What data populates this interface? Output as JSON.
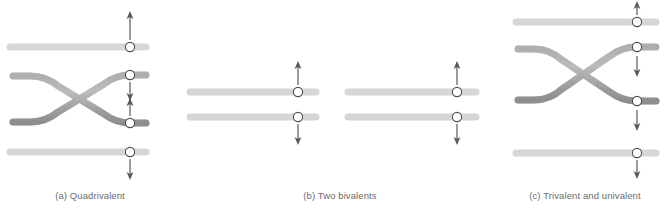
{
  "figure": {
    "type": "diagram",
    "background_color": "#ffffff",
    "chromosome_fill": "#a8a8a8",
    "chromosome_highlight": "#cfcfcf",
    "chromosome_outline": "#6e6e6e",
    "centromere_fill": "#ffffff",
    "centromere_outline": "#4d4d4d",
    "arrow_color": "#58595b",
    "caption_color": "#6b6c6e"
  },
  "panels": [
    {
      "id": "a",
      "label": "(a) Quadrivalent",
      "chromosome_count": 4,
      "crossover": true,
      "crossover_between": [
        2,
        3
      ],
      "chromosomes": [
        {
          "index": 1,
          "shape": "straight",
          "y": 47,
          "x_start": 8,
          "x_end": 148,
          "centromere_x": 130,
          "arrow": {
            "direction": "up",
            "position": "above"
          }
        },
        {
          "index": 2,
          "shape": "crossing",
          "y_left": 75,
          "y_right": 74,
          "x_start": 12,
          "x_end": 148,
          "centromere_x": 130,
          "arrow": {
            "direction": "down",
            "position": "below"
          }
        },
        {
          "index": 3,
          "shape": "crossing",
          "y_left": 122,
          "y_right": 123,
          "x_start": 12,
          "x_end": 148,
          "centromere_x": 130,
          "arrow": {
            "direction": "up",
            "position": "above"
          }
        },
        {
          "index": 4,
          "shape": "straight",
          "y": 152,
          "x_start": 8,
          "x_end": 148,
          "centromere_x": 130,
          "arrow": {
            "direction": "down",
            "position": "below"
          }
        }
      ],
      "arrow_sequence": [
        "up",
        "down",
        "up",
        "down"
      ]
    },
    {
      "id": "b",
      "label": "(b) Two bivalents",
      "chromosome_count": 4,
      "crossover": false,
      "groups": [
        {
          "name": "bivalent-left",
          "chromosomes": [
            {
              "index": 1,
              "shape": "straight",
              "y": 92,
              "x_start": 8,
              "x_end": 138,
              "centromere_x": 118,
              "arrow": {
                "direction": "up",
                "position": "above"
              }
            },
            {
              "index": 2,
              "shape": "straight",
              "y": 117,
              "x_start": 8,
              "x_end": 138,
              "centromere_x": 118,
              "arrow": {
                "direction": "down",
                "position": "below"
              }
            }
          ]
        },
        {
          "name": "bivalent-right",
          "chromosomes": [
            {
              "index": 3,
              "shape": "straight",
              "y": 92,
              "x_start": 165,
              "x_end": 297,
              "centromere_x": 277,
              "arrow": {
                "direction": "up",
                "position": "above"
              }
            },
            {
              "index": 4,
              "shape": "straight",
              "y": 117,
              "x_start": 165,
              "x_end": 297,
              "centromere_x": 277,
              "arrow": {
                "direction": "down",
                "position": "below"
              }
            }
          ]
        }
      ],
      "arrow_sequence": [
        "up",
        "down",
        "up",
        "down"
      ]
    },
    {
      "id": "c",
      "label": "(c) Trivalent and univalent",
      "chromosome_count": 4,
      "crossover": true,
      "crossover_between": [
        2,
        3
      ],
      "chromosomes": [
        {
          "index": 1,
          "shape": "straight",
          "y": 22,
          "x_start": 14,
          "x_end": 158,
          "centromere_x": 137,
          "arrow": {
            "direction": "up",
            "position": "above"
          }
        },
        {
          "index": 2,
          "shape": "crossing",
          "y_left": 48,
          "y_right": 47,
          "x_start": 16,
          "x_end": 158,
          "centromere_x": 137,
          "arrow": {
            "direction": "down",
            "position": "below"
          }
        },
        {
          "index": 3,
          "shape": "crossing",
          "y_left": 100,
          "y_right": 101,
          "x_start": 16,
          "x_end": 158,
          "centromere_x": 137,
          "arrow": {
            "direction": "down",
            "position": "below"
          }
        },
        {
          "index": 4,
          "shape": "straight",
          "y": 153,
          "x_start": 14,
          "x_end": 158,
          "centromere_x": 137,
          "arrow": {
            "direction": "down",
            "position": "below"
          }
        }
      ],
      "arrow_sequence": [
        "up",
        "down",
        "down",
        "down"
      ]
    }
  ]
}
